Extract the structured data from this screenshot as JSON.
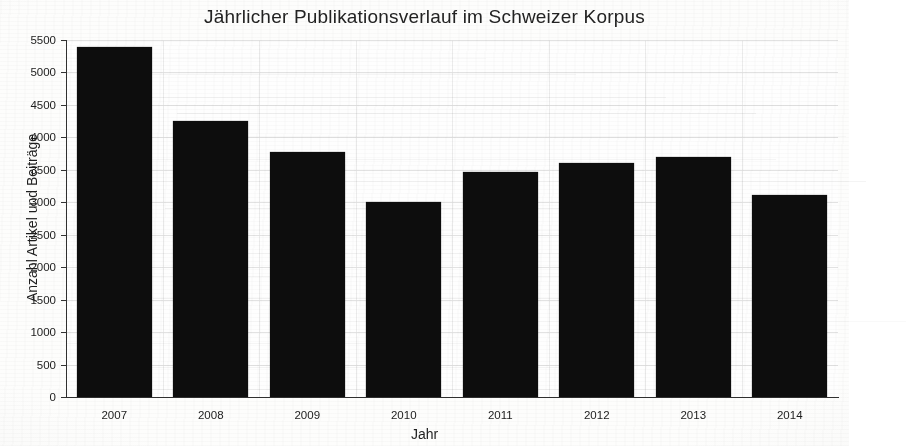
{
  "chart_data": {
    "type": "bar",
    "title": "Jährlicher Publikationsverlauf im Schweizer Korpus",
    "xlabel": "Jahr",
    "ylabel": "Anzahl Artikel und Beiträge",
    "categories": [
      "2007",
      "2008",
      "2009",
      "2010",
      "2011",
      "2012",
      "2013",
      "2014"
    ],
    "values": [
      5400,
      4250,
      3770,
      3000,
      3460,
      3600,
      3700,
      3110
    ],
    "series": [
      {
        "name": "Anzahl Artikel und Beiträge",
        "values": [
          5400,
          4250,
          3770,
          3000,
          3460,
          3600,
          3700,
          3110
        ]
      }
    ],
    "ylim": [
      0,
      5500
    ],
    "yticks": [
      0,
      500,
      1000,
      1500,
      2000,
      2500,
      3000,
      3500,
      4000,
      4500,
      5000,
      5500
    ],
    "ytick_labels": [
      "0",
      "500",
      "1000",
      "1500",
      "2000",
      "2500",
      "3000",
      "3500",
      "4000",
      "4500",
      "5000",
      "5500"
    ],
    "grid": true,
    "legend": false,
    "legend_position": "none",
    "bar_color": "#0d0d0d",
    "background_color": "#fdfdfc",
    "axis_color": "#303030",
    "grid_color": "#d8d8d8"
  }
}
